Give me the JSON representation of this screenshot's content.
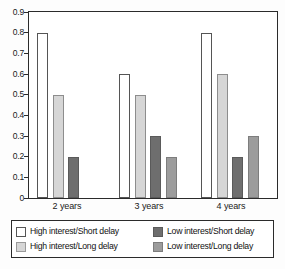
{
  "chart_data": {
    "type": "bar",
    "title": "",
    "subtitle": "",
    "xlabel": "",
    "ylabel": "",
    "categories": [
      "2 years",
      "3 years",
      "4 years"
    ],
    "ylim": [
      0,
      0.9
    ],
    "yticks": [
      "0.9",
      "0.8",
      "0.7",
      "0.6",
      "0.5",
      "0.4",
      "0.3",
      "0.2",
      "0.1",
      "0"
    ],
    "ytick_values": [
      0.9,
      0.8,
      0.7,
      0.6,
      0.5,
      0.4,
      0.3,
      0.2,
      0.1,
      0
    ],
    "grid": false,
    "legend_position": "bottom",
    "series": [
      {
        "name": "High interest/Short delay",
        "color": "#ffffff",
        "values": [
          0.8,
          0.6,
          0.8
        ]
      },
      {
        "name": "High interest/Long delay",
        "color": "#d6d6d6",
        "values": [
          0.5,
          0.5,
          0.6
        ]
      },
      {
        "name": "Low interest/Short delay",
        "color": "#6e6e6e",
        "values": [
          0.2,
          0.3,
          0.2
        ]
      },
      {
        "name": "Low interest/Long delay",
        "color": "#9c9c9c",
        "values": [
          null,
          0.2,
          0.3
        ]
      }
    ]
  },
  "axis": {
    "y_tick_labels": [
      "0.9",
      "0.8",
      "0.7",
      "0.6",
      "0.5",
      "0.4",
      "0.3",
      "0.2",
      "0.1",
      "0"
    ],
    "x_tick_labels": [
      "2 years",
      "3 years",
      "4 years"
    ]
  },
  "legend": {
    "entries": [
      {
        "label": "High interest/Short delay",
        "swatch": "s0"
      },
      {
        "label": "Low interest/Short delay",
        "swatch": "s2"
      },
      {
        "label": "High interest/Long delay",
        "swatch": "s1"
      },
      {
        "label": "Low interest/Long delay",
        "swatch": "s3"
      }
    ]
  }
}
